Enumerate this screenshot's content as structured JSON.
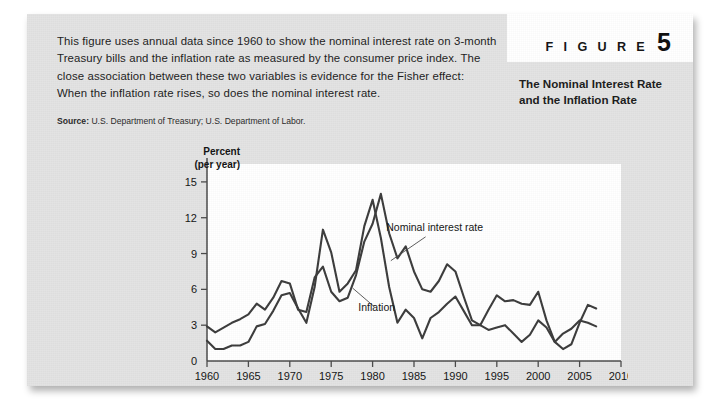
{
  "figure": {
    "label_word": "F I G U R E",
    "number": "5",
    "subtitle": "The Nominal Interest Rate and the Inflation Rate",
    "caption": "This figure uses annual data since 1960 to show the nominal interest rate on 3-month Treasury bills and the inflation rate as measured by the consumer price index. The close association between these two variables is evidence for the Fisher effect: When the inflation rate rises, so does the nominal interest rate.",
    "source_label": "Source:",
    "source_text": "U.S. Department of Treasury; U.S. Department of Labor."
  },
  "colors": {
    "card_background": "#e3e3e3",
    "plot_background": "#ffffff",
    "line": "#3c3c3c",
    "text": "#1b1b1b"
  },
  "chart_data": {
    "type": "line",
    "title": "The Nominal Interest Rate and the Inflation Rate",
    "xlabel": "",
    "ylabel": "Percent (per year)",
    "ylabel_line1": "Percent",
    "ylabel_line2": "(per year)",
    "grid": false,
    "legend_position": "inline-annotation",
    "xlim": [
      1960,
      2010
    ],
    "ylim": [
      0,
      16.5
    ],
    "xticks": [
      1960,
      1965,
      1970,
      1975,
      1980,
      1985,
      1990,
      1995,
      2000,
      2005,
      2010
    ],
    "xticklabels": [
      "1960",
      "1965",
      "1970",
      "1975",
      "1980",
      "1985",
      "1990",
      "1995",
      "2000",
      "2005",
      "2010"
    ],
    "yticks": [
      0,
      3,
      6,
      9,
      12,
      15
    ],
    "yticklabels": [
      "0",
      "3",
      "6",
      "9",
      "12",
      "15"
    ],
    "annotations": [
      {
        "text": "Nominal interest rate",
        "x": 1987.5,
        "y": 10.9
      },
      {
        "text": "Inflation",
        "x": 1980.5,
        "y": 4.2
      }
    ],
    "x": [
      1960,
      1961,
      1962,
      1963,
      1964,
      1965,
      1966,
      1967,
      1968,
      1969,
      1970,
      1971,
      1972,
      1973,
      1974,
      1975,
      1976,
      1977,
      1978,
      1979,
      1980,
      1981,
      1982,
      1983,
      1984,
      1985,
      1986,
      1987,
      1988,
      1989,
      1990,
      1991,
      1992,
      1993,
      1994,
      1995,
      1996,
      1997,
      1998,
      1999,
      2000,
      2001,
      2002,
      2003,
      2004,
      2005,
      2006,
      2007
    ],
    "series": [
      {
        "name": "Nominal interest rate",
        "values": [
          2.9,
          2.4,
          2.8,
          3.2,
          3.5,
          3.9,
          4.8,
          4.3,
          5.3,
          6.7,
          6.5,
          4.3,
          4.1,
          7.0,
          7.9,
          5.8,
          5.0,
          5.3,
          7.2,
          10.0,
          11.5,
          14.0,
          10.7,
          8.6,
          9.6,
          7.5,
          6.0,
          5.8,
          6.7,
          8.1,
          7.5,
          5.4,
          3.4,
          3.0,
          4.3,
          5.5,
          5.0,
          5.1,
          4.8,
          4.7,
          5.8,
          3.4,
          1.6,
          1.0,
          1.4,
          3.2,
          4.7,
          4.4
        ]
      },
      {
        "name": "Inflation",
        "values": [
          1.7,
          1.0,
          1.0,
          1.3,
          1.3,
          1.6,
          2.9,
          3.1,
          4.2,
          5.5,
          5.7,
          4.4,
          3.2,
          6.2,
          11.0,
          9.1,
          5.8,
          6.5,
          7.6,
          11.3,
          13.5,
          10.3,
          6.2,
          3.2,
          4.3,
          3.6,
          1.9,
          3.6,
          4.1,
          4.8,
          5.4,
          4.2,
          3.0,
          3.0,
          2.6,
          2.8,
          3.0,
          2.3,
          1.6,
          2.2,
          3.4,
          2.8,
          1.6,
          2.3,
          2.7,
          3.4,
          3.2,
          2.9
        ]
      }
    ]
  }
}
